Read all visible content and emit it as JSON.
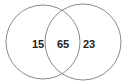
{
  "venn": {
    "left_only": "15",
    "intersection": "65",
    "right_only": "23",
    "stroke_color": "#888888",
    "text_color": "#222222"
  }
}
